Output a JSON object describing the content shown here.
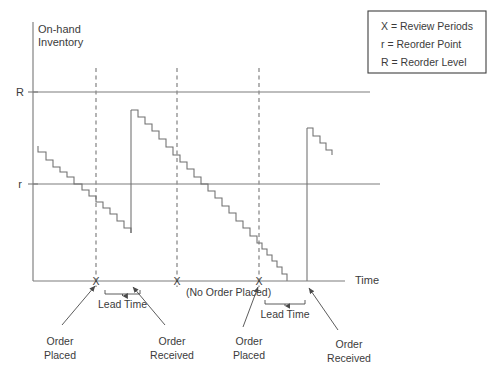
{
  "figure": {
    "y_axis_label_line1": "On-hand",
    "y_axis_label_line2": "Inventory",
    "x_axis_label": "Time",
    "tick_R": "R",
    "tick_r": "r"
  },
  "legend": {
    "entries": [
      "X = Review Periods",
      "r = Reorder Point",
      "R = Reorder Level"
    ]
  },
  "review_marks": [
    {
      "label": "X",
      "x": 96
    },
    {
      "label": "X",
      "x": 177
    },
    {
      "label": "X",
      "x": 259
    }
  ],
  "annotations": {
    "no_order": "(No Order Placed)",
    "lead_time_1": "Lead Time",
    "lead_time_2": "Lead Time",
    "order_placed_1_line1": "Order",
    "order_placed_1_line2": "Placed",
    "order_received_1_line1": "Order",
    "order_received_1_line2": "Received",
    "order_placed_2_line1": "Order",
    "order_placed_2_line2": "Placed",
    "order_received_2_line1": "Order",
    "order_received_2_line2": "Received"
  },
  "colors": {
    "axis": "#7d7d7d",
    "stair": "#6e6e6e",
    "dash": "#8c8c8c",
    "text": "#3b3b3b",
    "leader": "#4a4a4a",
    "background": "#ffffff"
  },
  "chart_data": {
    "type": "line",
    "title": "",
    "xlabel": "Time",
    "ylabel": "On-hand Inventory",
    "grid": false,
    "legend_position": "top-right",
    "axis_pixel_geometry": {
      "y_axis_x": 33,
      "x_axis_y": 281,
      "y_axis_top": 22,
      "x_axis_right": 345,
      "level_R_y": 92,
      "level_r_y": 184,
      "level_line_right_R": 370,
      "level_line_right_r": 380
    },
    "levels": [
      {
        "name": "R",
        "meaning": "Reorder Level",
        "y_px": 92
      },
      {
        "name": "r",
        "meaning": "Reorder Point",
        "y_px": 184
      }
    ],
    "review_periods_px": [
      96,
      177,
      259
    ],
    "events": [
      {
        "type": "order-placed",
        "at_review_px": 96,
        "lead_time_px": [
          105,
          140
        ]
      },
      {
        "type": "order-received",
        "at_px": 131
      },
      {
        "type": "no-order-placed",
        "at_review_px": 177
      },
      {
        "type": "order-placed",
        "at_review_px": 259,
        "lead_time_px": [
          265,
          305
        ]
      },
      {
        "type": "order-received",
        "at_px": 307
      }
    ],
    "series": [
      {
        "name": "On-hand inventory (stepped depletion)",
        "segments": [
          {
            "id": "segment-1",
            "description": "Initial stock depleting below reorder point r, order placed at first review X",
            "points_px": [
              [
                38,
                146
              ],
              [
                38,
                152
              ],
              [
                46,
                152
              ],
              [
                46,
                160
              ],
              [
                53,
                160
              ],
              [
                53,
                167
              ],
              [
                60,
                167
              ],
              [
                60,
                172
              ],
              [
                67,
                172
              ],
              [
                67,
                177
              ],
              [
                74,
                177
              ],
              [
                74,
                184
              ],
              [
                82,
                184
              ],
              [
                82,
                190
              ],
              [
                89,
                190
              ],
              [
                89,
                196
              ],
              [
                96,
                196
              ],
              [
                96,
                202
              ],
              [
                103,
                202
              ],
              [
                103,
                208
              ],
              [
                110,
                208
              ],
              [
                110,
                214
              ],
              [
                117,
                214
              ],
              [
                117,
                221
              ],
              [
                124,
                221
              ],
              [
                124,
                228
              ],
              [
                131,
                228
              ],
              [
                131,
                233
              ]
            ]
          },
          {
            "id": "riser-1",
            "description": "Order received: stock replenished to just below reorder level R",
            "points_px": [
              [
                131,
                233
              ],
              [
                131,
                110
              ]
            ]
          },
          {
            "id": "segment-2",
            "description": "Depletion from replenished level past second review X (no order placed) down through r to zero",
            "points_px": [
              [
                131,
                110
              ],
              [
                138,
                110
              ],
              [
                138,
                117
              ],
              [
                145,
                117
              ],
              [
                145,
                124
              ],
              [
                152,
                124
              ],
              [
                152,
                131
              ],
              [
                159,
                131
              ],
              [
                159,
                139
              ],
              [
                166,
                139
              ],
              [
                166,
                147
              ],
              [
                173,
                147
              ],
              [
                173,
                155
              ],
              [
                180,
                155
              ],
              [
                180,
                162
              ],
              [
                187,
                162
              ],
              [
                187,
                169
              ],
              [
                194,
                169
              ],
              [
                194,
                177
              ],
              [
                201,
                177
              ],
              [
                201,
                184
              ],
              [
                208,
                184
              ],
              [
                208,
                191
              ],
              [
                215,
                191
              ],
              [
                215,
                198
              ],
              [
                222,
                198
              ],
              [
                222,
                206
              ],
              [
                229,
                206
              ],
              [
                229,
                213
              ],
              [
                236,
                213
              ],
              [
                236,
                221
              ],
              [
                243,
                221
              ],
              [
                243,
                228
              ],
              [
                250,
                228
              ],
              [
                250,
                236
              ],
              [
                257,
                236
              ],
              [
                257,
                243
              ],
              [
                262,
                243
              ],
              [
                262,
                249
              ],
              [
                267,
                249
              ],
              [
                267,
                255
              ],
              [
                272,
                255
              ],
              [
                272,
                261
              ],
              [
                277,
                261
              ],
              [
                277,
                267
              ],
              [
                282,
                267
              ],
              [
                282,
                274
              ],
              [
                287,
                274
              ],
              [
                287,
                281
              ]
            ]
          },
          {
            "id": "riser-2",
            "description": "Second order received after lead time: stock rises above reorder point r",
            "points_px": [
              [
                307,
                281
              ],
              [
                307,
                128
              ]
            ]
          },
          {
            "id": "segment-3",
            "description": "Depletion following second replenishment (end of horizon)",
            "points_px": [
              [
                307,
                128
              ],
              [
                313,
                128
              ],
              [
                313,
                136
              ],
              [
                320,
                136
              ],
              [
                320,
                143
              ],
              [
                326,
                143
              ],
              [
                326,
                150
              ],
              [
                332,
                150
              ],
              [
                332,
                155
              ]
            ]
          }
        ]
      }
    ]
  }
}
